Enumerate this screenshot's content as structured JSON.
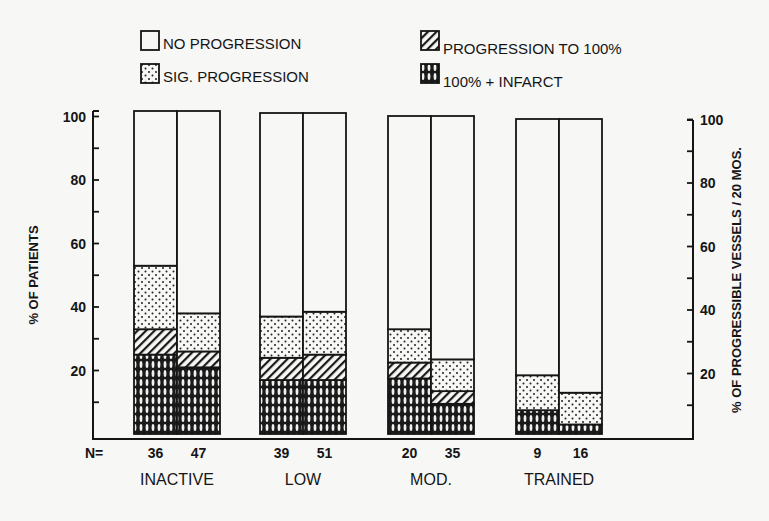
{
  "chart_data": {
    "type": "bar",
    "subtype": "stacked-grouped",
    "title": "",
    "ylabel": "% OF PATIENTS",
    "ylabel_right": "% OF PROGRESSIBLE VESSELS / 20 MOS.",
    "xlabel": "",
    "ylim": [
      0,
      100
    ],
    "yticks": [
      20,
      40,
      60,
      80,
      100
    ],
    "yticks_right": [
      20,
      40,
      60,
      80,
      100
    ],
    "grid": false,
    "legend_position": "top",
    "n_label": "N=",
    "groups": [
      "INACTIVE",
      "LOW",
      "MOD.",
      "TRAINED"
    ],
    "bars": [
      {
        "group": "INACTIVE",
        "index": 0,
        "n": "36",
        "measure": "% of patients"
      },
      {
        "group": "INACTIVE",
        "index": 1,
        "n": "47",
        "measure": "% of progressible vessels"
      },
      {
        "group": "LOW",
        "index": 0,
        "n": "39",
        "measure": "% of patients"
      },
      {
        "group": "LOW",
        "index": 1,
        "n": "51",
        "measure": "% of progressible vessels"
      },
      {
        "group": "MOD.",
        "index": 0,
        "n": "20",
        "measure": "% of patients"
      },
      {
        "group": "MOD.",
        "index": 1,
        "n": "35",
        "measure": "% of progressible vessels"
      },
      {
        "group": "TRAINED",
        "index": 0,
        "n": "9",
        "measure": "% of patients"
      },
      {
        "group": "TRAINED",
        "index": 1,
        "n": "16",
        "measure": "% of progressible vessels"
      }
    ],
    "categories": [
      "INACTIVE-36",
      "INACTIVE-47",
      "LOW-39",
      "LOW-51",
      "MOD.-20",
      "MOD.-35",
      "TRAINED-9",
      "TRAINED-16"
    ],
    "series": [
      {
        "name": "100% + INFARCT",
        "pattern": "crosshatch",
        "values": [
          25,
          21,
          17,
          17,
          17.5,
          9.5,
          7.5,
          3
        ]
      },
      {
        "name": "PROGRESSION TO 100%",
        "pattern": "diagonal",
        "values": [
          8,
          5,
          7,
          8,
          5,
          4,
          0,
          0
        ]
      },
      {
        "name": "SIG. PROGRESSION",
        "pattern": "dots",
        "values": [
          20,
          12,
          13,
          13.5,
          10.5,
          10,
          11,
          10
        ]
      },
      {
        "name": "NO PROGRESSION",
        "pattern": "blank",
        "values": [
          47,
          62,
          63,
          61.5,
          67,
          76.5,
          81.5,
          87
        ]
      }
    ],
    "cumulative_tops": {
      "infarct": [
        25,
        21,
        17,
        17,
        17.5,
        9.5,
        7.5,
        3
      ],
      "progression_to_100": [
        33,
        26,
        24,
        25,
        22.5,
        13.5,
        7.5,
        3
      ],
      "sig_progression": [
        53,
        38,
        37,
        38.5,
        33,
        23.5,
        18.5,
        13
      ]
    }
  },
  "legend": {
    "items": [
      {
        "label": "NO PROGRESSION",
        "pattern": "blank"
      },
      {
        "label": "SIG. PROGRESSION",
        "pattern": "dots"
      },
      {
        "label": "PROGRESSION TO 100%",
        "pattern": "diagonal"
      },
      {
        "label": "100% + INFARCT",
        "pattern": "crosshatch"
      }
    ]
  },
  "colors": {
    "ink": "#151515",
    "paper": "#f7f7f5"
  }
}
